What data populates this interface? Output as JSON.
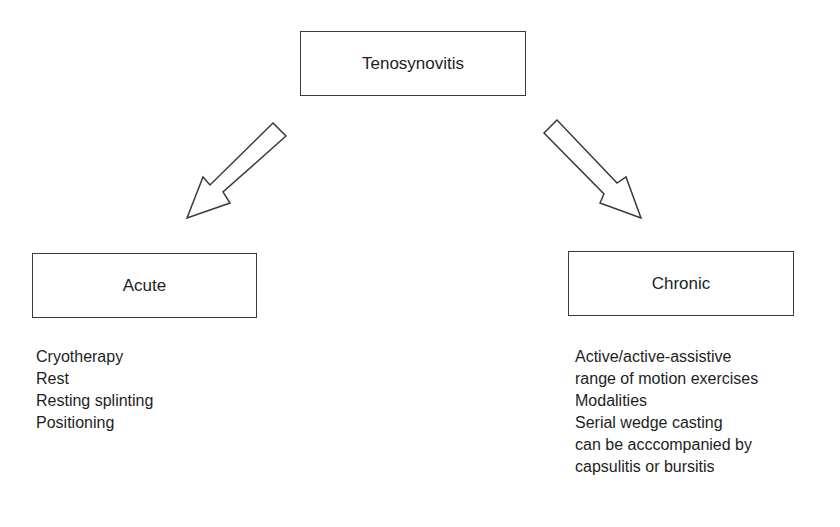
{
  "diagram": {
    "root": {
      "label": "Tenosynovitis"
    },
    "branches": [
      {
        "label": "Acute",
        "items": [
          "Cryotherapy",
          "Rest",
          "Resting splinting",
          "Positioning"
        ]
      },
      {
        "label": "Chronic",
        "items": [
          "Active/active-assistive",
          "range of motion exercises",
          "Modalities",
          "Serial wedge casting",
          "can be acccompanied by",
          "capsulitis or bursitis"
        ]
      }
    ],
    "edges": [
      {
        "from": "Tenosynovitis",
        "to": "Acute",
        "style": "hollow-arrow"
      },
      {
        "from": "Tenosynovitis",
        "to": "Chronic",
        "style": "hollow-arrow"
      }
    ]
  }
}
